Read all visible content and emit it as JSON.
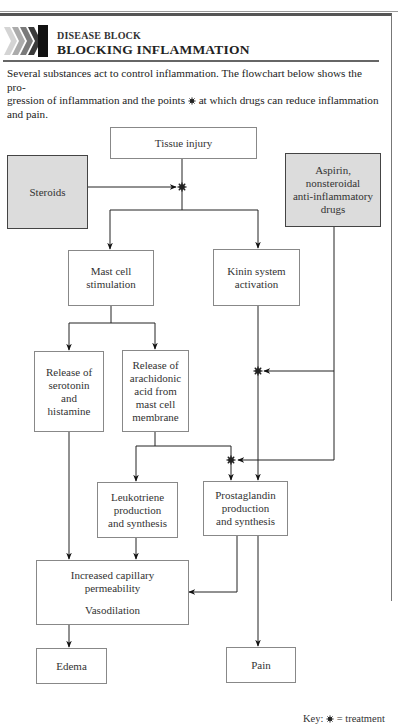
{
  "header": {
    "kicker": "DISEASE BLOCK",
    "title": "BLOCKING INFLAMMATION",
    "intro_line1": "Several substances act to control inflammation. The flowchart below shows the pro-",
    "intro_line2_a": "gression of inflammation and the points",
    "intro_line2_b": "at which drugs can reduce inflammation",
    "intro_line3": "and pain."
  },
  "colors": {
    "drug_box_fill": "#dcdcdc",
    "line": "#222222",
    "box_border": "#888888"
  },
  "nodes": {
    "tissue_injury": {
      "lines": [
        "Tissue injury"
      ]
    },
    "steroids": {
      "lines": [
        "Steroids"
      ]
    },
    "aspirin": {
      "lines": [
        "Aspirin,",
        "nonsteroidal",
        "anti-inflammatory",
        "drugs"
      ]
    },
    "mast_cell": {
      "lines": [
        "Mast cell",
        "stimulation"
      ]
    },
    "kinin": {
      "lines": [
        "Kinin system",
        "activation"
      ]
    },
    "serotonin": {
      "lines": [
        "Release of",
        "serotonin",
        "and",
        "histamine"
      ]
    },
    "arachidonic": {
      "lines": [
        "Release of",
        "arachidonic",
        "acid from",
        "mast cell",
        "membrane"
      ]
    },
    "leukotriene": {
      "lines": [
        "Leukotriene",
        "production",
        "and synthesis"
      ]
    },
    "prostaglandin": {
      "lines": [
        "Prostaglandin",
        "production",
        "and synthesis"
      ]
    },
    "increased": {
      "lines": [
        "Increased capillary",
        "permeability",
        "",
        "Vasodilation"
      ]
    },
    "edema": {
      "lines": [
        "Edema"
      ]
    },
    "pain": {
      "lines": [
        "Pain"
      ]
    }
  },
  "edges": [
    {
      "from": "tissue_injury",
      "to": "mast_cell"
    },
    {
      "from": "tissue_injury",
      "to": "kinin"
    },
    {
      "from": "steroids",
      "to": "treatment_point_1",
      "type": "blocks"
    },
    {
      "from": "mast_cell",
      "to": "serotonin"
    },
    {
      "from": "mast_cell",
      "to": "arachidonic"
    },
    {
      "from": "aspirin",
      "to": "treatment_point_2",
      "type": "blocks"
    },
    {
      "from": "aspirin",
      "to": "treatment_point_3",
      "type": "blocks"
    },
    {
      "from": "arachidonic",
      "to": "leukotriene"
    },
    {
      "from": "arachidonic",
      "to": "prostaglandin"
    },
    {
      "from": "kinin",
      "to": "prostaglandin"
    },
    {
      "from": "serotonin",
      "to": "increased"
    },
    {
      "from": "leukotriene",
      "to": "increased"
    },
    {
      "from": "prostaglandin",
      "to": "increased"
    },
    {
      "from": "prostaglandin",
      "to": "pain"
    },
    {
      "from": "increased",
      "to": "edema"
    }
  ],
  "key": {
    "prefix": "Key:",
    "suffix": "= treatment"
  }
}
